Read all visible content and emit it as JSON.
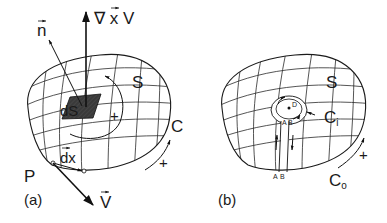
{
  "panels": [
    {
      "id": "a",
      "caption": "(a)",
      "labels": {
        "curl": "∇ x V",
        "normal": "n",
        "surface": "S",
        "element": "dS",
        "plus_inner": "+",
        "contour": "C",
        "plus_outer": "+",
        "dx": "dx",
        "point": "P",
        "velocity": "V"
      }
    },
    {
      "id": "b",
      "caption": "(b)",
      "labels": {
        "surface": "S",
        "point_d": "D",
        "inner_contour_main": "C",
        "inner_contour_sub": "i",
        "outer_contour_main": "C",
        "outer_contour_sub": "o",
        "plus_outer": "+",
        "cut_a_top": "A",
        "cut_b_top": "B",
        "cut_a_bottom": "A",
        "cut_b_bottom": "B"
      }
    }
  ],
  "colors": {
    "ink": "#1a1a1a",
    "shaded_element": "#3a3a3a",
    "background": "#ffffff"
  }
}
